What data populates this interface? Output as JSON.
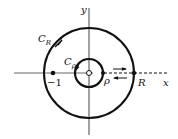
{
  "diagram": {
    "axes": {
      "x_label": "x",
      "y_label": "y"
    },
    "outer_contour": {
      "label": "C",
      "subscript": "R",
      "point_label": "R"
    },
    "inner_contour": {
      "label": "C",
      "subscript": "ρ",
      "point_label": "ρ"
    },
    "marked_point": {
      "label": "−1"
    },
    "colors": {
      "stroke": "#111111",
      "background": "#ffffff"
    }
  }
}
